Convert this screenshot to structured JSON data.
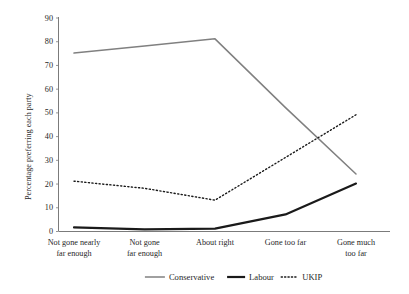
{
  "chart_data": {
    "type": "line",
    "title": "",
    "xlabel": "",
    "ylabel": "Percentage preferring each party",
    "ylim": [
      0,
      90
    ],
    "yticks": [
      0,
      10,
      20,
      30,
      40,
      50,
      60,
      70,
      80,
      90
    ],
    "ytick_labels": [
      "0",
      "10",
      "20",
      "30",
      "40",
      "50",
      "60",
      "70",
      "80",
      "90"
    ],
    "grid": false,
    "legend_position": "bottom",
    "categories": [
      "Not gone nearly far enough",
      "Not gone far enough",
      "About right",
      "Gone too far",
      "Gone much too far"
    ],
    "category_lines": [
      [
        "Not gone nearly",
        "far enough"
      ],
      [
        "Not gone",
        "far enough"
      ],
      [
        "About right",
        ""
      ],
      [
        "Gone too far",
        ""
      ],
      [
        "Gone much",
        "too far"
      ]
    ],
    "series": [
      {
        "name": "Conservative",
        "values": [
          75,
          78,
          81,
          52,
          24
        ],
        "color": "#808080",
        "style": "solid",
        "width": 1.5
      },
      {
        "name": "Labour",
        "values": [
          1.5,
          0.7,
          1,
          7,
          20
        ],
        "color": "#1a1a1a",
        "style": "solid",
        "width": 2.2
      },
      {
        "name": "UKIP",
        "values": [
          21,
          18,
          13,
          31,
          49
        ],
        "color": "#1a1a1a",
        "style": "dotted",
        "width": 1.4
      }
    ]
  },
  "legend": {
    "items": [
      {
        "label": "Conservative"
      },
      {
        "label": "Labour"
      },
      {
        "label": "UKIP"
      }
    ]
  },
  "axes": {
    "y_title": "Percentage preferring each party"
  }
}
